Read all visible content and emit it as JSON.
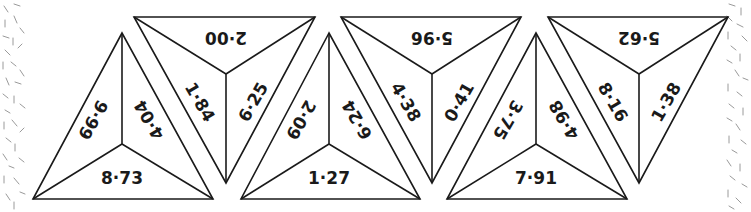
{
  "colors": {
    "line": "#1a1a1a",
    "background": "#ffffff",
    "edge_pattern": "#9a9a9a"
  },
  "pieces": [
    {
      "id": 1,
      "orientation": "up",
      "labels": {
        "left": "9·99",
        "right": "4·04",
        "bottom": "8·73"
      }
    },
    {
      "id": 2,
      "orientation": "down",
      "labels": {
        "top": "2·00",
        "left": "1·84",
        "right": "6·25"
      }
    },
    {
      "id": 3,
      "orientation": "up",
      "labels": {
        "left": "2·09",
        "right": "6·24",
        "bottom": "1·27"
      }
    },
    {
      "id": 4,
      "orientation": "down",
      "labels": {
        "top": "5·96",
        "left": "4·38",
        "right": "0·41"
      }
    },
    {
      "id": 5,
      "orientation": "up",
      "labels": {
        "left": "3·75",
        "right": "4·98",
        "bottom": "7·91"
      }
    },
    {
      "id": 6,
      "orientation": "down",
      "labels": {
        "top": "5·62",
        "left": "8·16",
        "right": "1·38"
      }
    }
  ]
}
